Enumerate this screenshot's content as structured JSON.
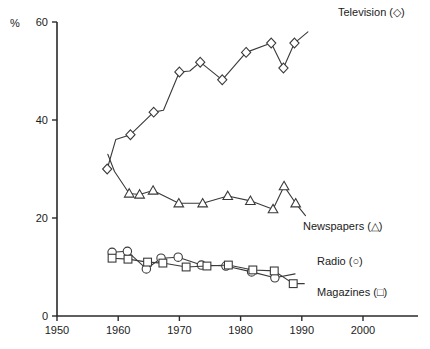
{
  "chart_data": {
    "type": "line",
    "title": "",
    "subtitle": "",
    "xlabel": "",
    "ylabel": "%",
    "unit_label": "%",
    "xlim": [
      1950,
      2005
    ],
    "ylim": [
      0,
      60
    ],
    "xticks": [
      1950,
      1960,
      1970,
      1980,
      1990,
      2000
    ],
    "xtick_labels": [
      "1950",
      "1960",
      "1970",
      "1980",
      "1990",
      "2000"
    ],
    "yticks": [
      0,
      20,
      40,
      60
    ],
    "ytick_labels": [
      "0",
      "20",
      "40",
      "60"
    ],
    "grid": false,
    "legend_position": "inline-right",
    "series": [
      {
        "name": "Television",
        "marker": "diamond",
        "legend_label": "Television (◇)",
        "points": [
          {
            "x": 1958.2,
            "y": 30.0
          },
          {
            "x": 1959.6,
            "y": 36.0
          },
          {
            "x": 1962.0,
            "y": 37.0
          },
          {
            "x": 1965.8,
            "y": 41.6
          },
          {
            "x": 1967.4,
            "y": 42.0
          },
          {
            "x": 1970.0,
            "y": 49.8
          },
          {
            "x": 1971.7,
            "y": 50.0
          },
          {
            "x": 1973.4,
            "y": 51.8
          },
          {
            "x": 1977.0,
            "y": 48.2
          },
          {
            "x": 1980.9,
            "y": 53.8
          },
          {
            "x": 1985.0,
            "y": 55.7
          },
          {
            "x": 1987.0,
            "y": 50.6
          },
          {
            "x": 1988.8,
            "y": 55.7
          },
          {
            "x": 1991.0,
            "y": 58.0
          }
        ]
      },
      {
        "name": "Newspapers",
        "marker": "triangle",
        "legend_label": "Newspapers (△)",
        "points": [
          {
            "x": 1958.3,
            "y": 33.0
          },
          {
            "x": 1959.4,
            "y": 29.5
          },
          {
            "x": 1961.8,
            "y": 25.0
          },
          {
            "x": 1963.5,
            "y": 24.8
          },
          {
            "x": 1965.7,
            "y": 25.6
          },
          {
            "x": 1969.9,
            "y": 23.0
          },
          {
            "x": 1973.8,
            "y": 23.0
          },
          {
            "x": 1977.9,
            "y": 24.5
          },
          {
            "x": 1981.6,
            "y": 23.5
          },
          {
            "x": 1985.3,
            "y": 21.8
          },
          {
            "x": 1987.1,
            "y": 26.5
          },
          {
            "x": 1989.0,
            "y": 23.0
          },
          {
            "x": 1990.6,
            "y": 20.5
          }
        ]
      },
      {
        "name": "Radio",
        "marker": "circle",
        "legend_label": "Radio (○)",
        "points": [
          {
            "x": 1959.0,
            "y": 13.0
          },
          {
            "x": 1961.5,
            "y": 13.2
          },
          {
            "x": 1964.6,
            "y": 9.6
          },
          {
            "x": 1967.0,
            "y": 11.8
          },
          {
            "x": 1969.8,
            "y": 12.0
          },
          {
            "x": 1973.6,
            "y": 10.4
          },
          {
            "x": 1977.6,
            "y": 10.2
          },
          {
            "x": 1981.8,
            "y": 9.0
          },
          {
            "x": 1985.6,
            "y": 7.8
          },
          {
            "x": 1988.9,
            "y": 8.6
          }
        ]
      },
      {
        "name": "Magazines",
        "marker": "square",
        "legend_label": "Magazines (□)",
        "points": [
          {
            "x": 1959.0,
            "y": 11.8
          },
          {
            "x": 1961.6,
            "y": 11.6
          },
          {
            "x": 1964.8,
            "y": 11.0
          },
          {
            "x": 1967.3,
            "y": 10.8
          },
          {
            "x": 1971.1,
            "y": 10.0
          },
          {
            "x": 1974.5,
            "y": 10.2
          },
          {
            "x": 1978.0,
            "y": 10.4
          },
          {
            "x": 1982.0,
            "y": 9.4
          },
          {
            "x": 1985.5,
            "y": 9.2
          },
          {
            "x": 1988.6,
            "y": 6.6
          },
          {
            "x": 1990.4,
            "y": 6.6
          }
        ]
      }
    ],
    "annotations": [
      {
        "id": "television",
        "text": "Television (◇)",
        "x_px": 338,
        "y_px": 16
      },
      {
        "id": "newspapers",
        "text": "Newspapers (△)",
        "x_px": 303,
        "y_px": 230
      },
      {
        "id": "radio",
        "text": "Radio (○)",
        "x_px": 317,
        "y_px": 265
      },
      {
        "id": "magazines",
        "text": "Magazines (□)",
        "x_px": 317,
        "y_px": 296
      }
    ]
  }
}
